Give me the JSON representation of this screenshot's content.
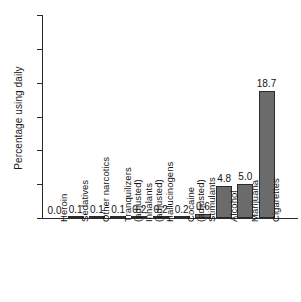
{
  "chart_data": {
    "type": "bar",
    "title": "",
    "xlabel": "",
    "ylabel": "Percentage using daily",
    "ylim": [
      0,
      30
    ],
    "yticks": [
      0,
      5,
      10,
      15,
      20,
      25,
      30
    ],
    "ytick_labels": [
      "0",
      "5",
      "10",
      "15",
      "20",
      "25",
      "30"
    ],
    "grid": false,
    "legend": null,
    "orientation": "vertical",
    "value_labels_shown": true,
    "categories": [
      "Heroin",
      "Sedatives",
      "Other narcotics",
      "Tranquilizers",
      "Inhalants\n(adjusted)",
      "Hallucinogens\n(adjusted)",
      "Cocaine",
      "Stimulants\n(adjusted)",
      "Alcohol",
      "Marijuana",
      "Cigarettes"
    ],
    "values": [
      0.0,
      0.1,
      0.1,
      0.1,
      0.2,
      0.2,
      0.2,
      0.6,
      4.8,
      5.0,
      18.7
    ],
    "value_labels": [
      "0.0",
      "0.1",
      "0.1",
      "0.1",
      "0.2",
      "0.2",
      "0.2",
      "0.6",
      "4.8",
      "5.0",
      "18.7"
    ],
    "bar_color": "#6b6b6b",
    "bar_edge_color": "#2b2b2b",
    "axis_color": "#2a2a2a",
    "text_color": "#141414",
    "background_color": "#ffffff"
  }
}
